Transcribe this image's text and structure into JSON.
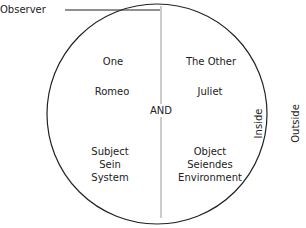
{
  "diagram": {
    "observer_label": "Observer",
    "center_label": "AND",
    "left_half": {
      "top": "One",
      "middle": "Romeo",
      "bottom_lines": [
        "Subject",
        "Sein",
        "System"
      ]
    },
    "right_half": {
      "top": "The Other",
      "middle": "Juliet",
      "bottom_lines": [
        "Object",
        "Seiendes",
        "Environment"
      ]
    },
    "inside_label": "Inside",
    "outside_label": "Outside",
    "colors": {
      "stroke": "#222222",
      "divider": "#999999",
      "text": "#222222"
    }
  }
}
